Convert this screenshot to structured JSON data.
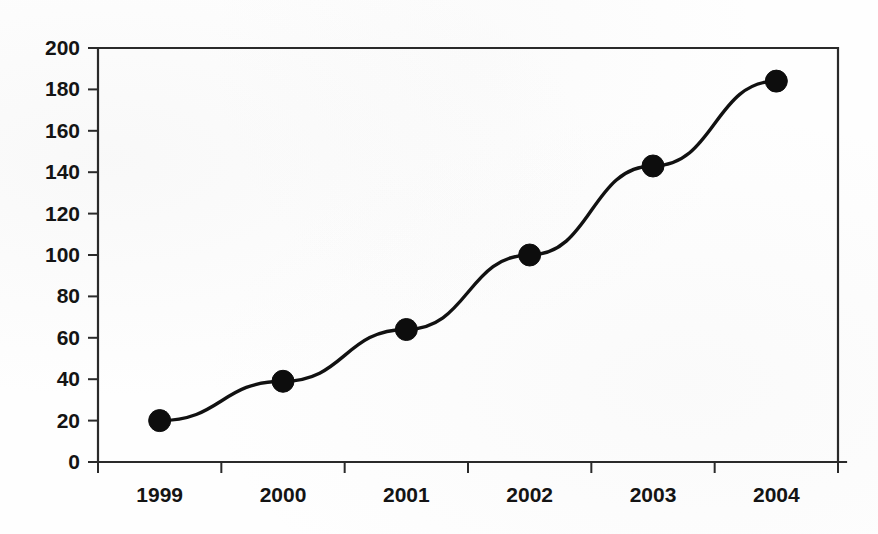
{
  "chart_data": {
    "type": "line",
    "title": "",
    "subtitle": "",
    "xlabel": "",
    "ylabel": "",
    "categories": [
      "1999",
      "2000",
      "2001",
      "2002",
      "2003",
      "2004"
    ],
    "values": [
      20,
      39,
      64,
      100,
      143,
      184
    ],
    "series": [
      {
        "name": "Series 1",
        "values": [
          20,
          39,
          64,
          100,
          143,
          184
        ]
      }
    ],
    "ylim": [
      0,
      200
    ],
    "ytick_step": 20,
    "ytick_labels": [
      "0",
      "20",
      "40",
      "60",
      "80",
      "100",
      "120",
      "140",
      "160",
      "180",
      "200"
    ],
    "xtick_labels": [
      "1999",
      "2000",
      "2001",
      "2002",
      "2003",
      "2004"
    ],
    "grid": false,
    "legend": false,
    "legend_position": "none",
    "marker": "filled-circle",
    "line_color": "#111111",
    "marker_color": "#0d0d0d",
    "axis_color": "#2a2a2a",
    "background_color": "#fefefe",
    "annotations": []
  },
  "chart": {
    "figure_name": "line-chart-figure",
    "plot_area_name": "plot-area"
  }
}
